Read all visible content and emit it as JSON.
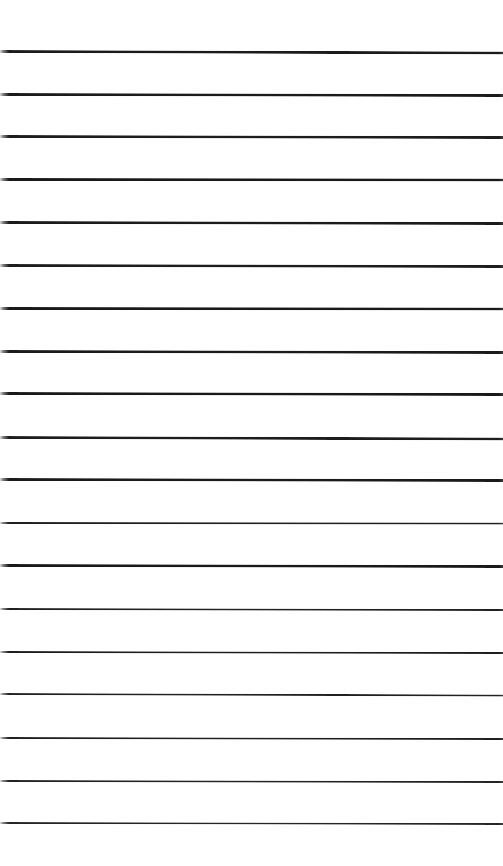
{
  "document": {
    "kind": "lined-paper-scan",
    "page_width": 503,
    "page_height": 866,
    "background_color": "#ffffff",
    "rule_color": "#1a1a1a",
    "rule_count": 19,
    "content_text": "",
    "notes_written": "none"
  },
  "ruling": {
    "orientation": "horizontal",
    "first_rule_y": 51,
    "last_rule_y": 823,
    "average_spacing": 42.9,
    "left_margin_x": 0,
    "right_extent_x": 503,
    "has_vertical_margin_rule": false,
    "has_header_rule": false
  },
  "rules": [
    {
      "index": 1,
      "y": 51,
      "thickness": 2.6,
      "color": "#1c1c1c",
      "x_start": 0,
      "x_end": 503,
      "slope_px": 1.5
    },
    {
      "index": 2,
      "y": 94,
      "thickness": 2.6,
      "color": "#1c1c1c",
      "x_start": 0,
      "x_end": 503,
      "slope_px": 1.0
    },
    {
      "index": 3,
      "y": 136,
      "thickness": 2.5,
      "color": "#1e1e1e",
      "x_start": 0,
      "x_end": 503,
      "slope_px": 1.0
    },
    {
      "index": 4,
      "y": 179,
      "thickness": 2.7,
      "color": "#1a1a1a",
      "x_start": 0,
      "x_end": 503,
      "slope_px": 0.5
    },
    {
      "index": 5,
      "y": 222,
      "thickness": 2.6,
      "color": "#1c1c1c",
      "x_start": 0,
      "x_end": 503,
      "slope_px": 1.0
    },
    {
      "index": 6,
      "y": 265,
      "thickness": 2.5,
      "color": "#1e1e1e",
      "x_start": 0,
      "x_end": 503,
      "slope_px": 1.0
    },
    {
      "index": 7,
      "y": 308,
      "thickness": 2.6,
      "color": "#1a1a1a",
      "x_start": 0,
      "x_end": 503,
      "slope_px": 0.5
    },
    {
      "index": 8,
      "y": 351,
      "thickness": 2.5,
      "color": "#1c1c1c",
      "x_start": 0,
      "x_end": 503,
      "slope_px": 1.0
    },
    {
      "index": 9,
      "y": 393,
      "thickness": 2.6,
      "color": "#1a1a1a",
      "x_start": 0,
      "x_end": 503,
      "slope_px": 1.0
    },
    {
      "index": 10,
      "y": 437,
      "thickness": 2.5,
      "color": "#1e1e1e",
      "x_start": 0,
      "x_end": 503,
      "slope_px": 1.5
    },
    {
      "index": 11,
      "y": 479,
      "thickness": 2.6,
      "color": "#1c1c1c",
      "x_start": 0,
      "x_end": 503,
      "slope_px": 1.0
    },
    {
      "index": 12,
      "y": 523,
      "thickness": 2.4,
      "color": "#202020",
      "x_start": 0,
      "x_end": 503,
      "slope_px": 0.5
    },
    {
      "index": 13,
      "y": 565,
      "thickness": 2.6,
      "color": "#1a1a1a",
      "x_start": 0,
      "x_end": 503,
      "slope_px": 1.0
    },
    {
      "index": 14,
      "y": 609,
      "thickness": 2.3,
      "color": "#222222",
      "x_start": 0,
      "x_end": 503,
      "slope_px": 1.0
    },
    {
      "index": 15,
      "y": 652,
      "thickness": 2.4,
      "color": "#1e1e1e",
      "x_start": 0,
      "x_end": 503,
      "slope_px": 1.0
    },
    {
      "index": 16,
      "y": 694,
      "thickness": 2.3,
      "color": "#222222",
      "x_start": 0,
      "x_end": 503,
      "slope_px": 1.5
    },
    {
      "index": 17,
      "y": 738,
      "thickness": 2.3,
      "color": "#202020",
      "x_start": 0,
      "x_end": 503,
      "slope_px": 1.0
    },
    {
      "index": 18,
      "y": 781,
      "thickness": 2.2,
      "color": "#242424",
      "x_start": 0,
      "x_end": 503,
      "slope_px": 1.0
    },
    {
      "index": 19,
      "y": 823,
      "thickness": 1.9,
      "color": "#262626",
      "x_start": 0,
      "x_end": 503,
      "slope_px": 1.0
    }
  ]
}
